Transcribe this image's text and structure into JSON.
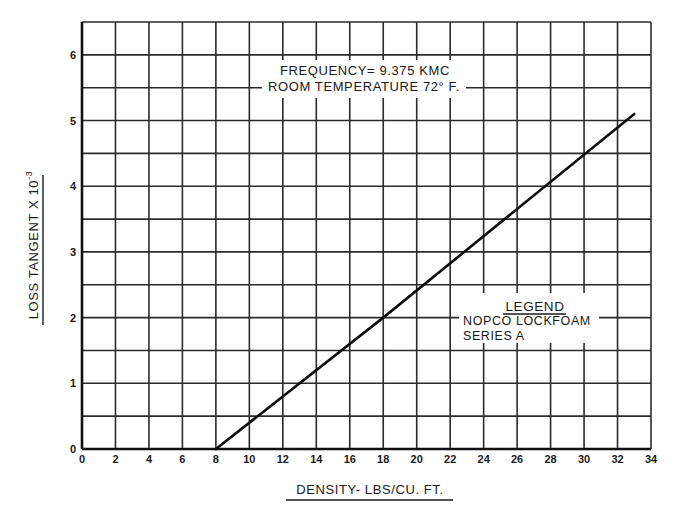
{
  "chart_data": {
    "type": "line",
    "title": "",
    "xlabel": "DENSITY- LBS/CU. FT.",
    "ylabel": "LOSS TANGENT X 10",
    "ylabel_exponent": "-3",
    "xlim": [
      0,
      34
    ],
    "ylim": [
      0,
      6.5
    ],
    "x_ticks": [
      0,
      2,
      4,
      6,
      8,
      10,
      12,
      14,
      16,
      18,
      20,
      22,
      24,
      26,
      28,
      30,
      32,
      34
    ],
    "y_ticks": [
      0,
      1,
      2,
      3,
      4,
      5,
      6
    ],
    "x_grid_step": 2,
    "y_grid_step": 0.5,
    "grid": true,
    "legend_position": "center-right inside plot",
    "series": [
      {
        "name": "NOPCO LOCKFOAM SERIES A",
        "x": [
          8,
          18,
          33
        ],
        "y": [
          0,
          2.0,
          5.1
        ]
      }
    ],
    "annotations": [
      "FREQUENCY= 9.375 KMC",
      "ROOM TEMPERATURE 72° F."
    ]
  },
  "annotation": {
    "frequency": "FREQUENCY= 9.375 KMC",
    "temperature": "ROOM TEMPERATURE 72° F."
  },
  "legend": {
    "title": "LEGEND",
    "line1": "NOPCO LOCKFOAM",
    "line2": "SERIES A"
  },
  "axes": {
    "xlabel": "DENSITY- LBS/CU. FT.",
    "ylabel": "LOSS TANGENT X 10",
    "ylabel_exponent": "-3"
  }
}
